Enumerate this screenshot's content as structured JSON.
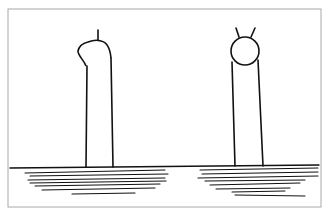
{
  "figure": {
    "colors": {
      "background": "#ffffff",
      "frame": "#a8a8a8",
      "ink": "#111111"
    },
    "frame": {
      "x": 8,
      "y": 9,
      "width": 313,
      "height": 198
    },
    "ground_line": {
      "x1": 10,
      "y1": 168,
      "x2": 319,
      "y2": 165
    },
    "left_figure": {
      "name": "figure-with-single-spike",
      "body_left": [
        [
          87,
          66
        ],
        [
          86,
          167
        ]
      ],
      "body_right": [
        [
          111,
          58
        ],
        [
          113,
          167
        ]
      ],
      "head_path": "M86 66 C84 60 78 56 78 51 C79 46 84 43 88 42 C93 40 98 40 101 41 C106 42 110 48 111 58",
      "spike": [
        [
          98,
          40
        ],
        [
          98,
          30
        ]
      ]
    },
    "right_figure": {
      "name": "figure-with-round-head-and-two-horns",
      "head_circle": {
        "cx": 245,
        "cy": 51,
        "r": 14
      },
      "body_left": [
        [
          232,
          62
        ],
        [
          235,
          166
        ]
      ],
      "body_right": [
        [
          258,
          60
        ],
        [
          263,
          166
        ]
      ],
      "horns": [
        [
          [
            239,
            37
          ],
          [
            236,
            28
          ]
        ],
        [
          [
            251,
            37
          ],
          [
            255,
            28
          ]
        ]
      ]
    },
    "hatching_left": [
      [
        [
          25,
          173
        ],
        [
          165,
          170
        ]
      ],
      [
        [
          30,
          176
        ],
        [
          168,
          174
        ]
      ],
      [
        [
          28,
          180
        ],
        [
          165,
          178
        ]
      ],
      [
        [
          30,
          183
        ],
        [
          166,
          181
        ]
      ],
      [
        [
          35,
          186
        ],
        [
          160,
          184
        ]
      ],
      [
        [
          42,
          190
        ],
        [
          155,
          188
        ]
      ],
      [
        [
          72,
          194
        ],
        [
          135,
          193
        ]
      ]
    ],
    "hatching_right": [
      [
        [
          200,
          170
        ],
        [
          318,
          168
        ]
      ],
      [
        [
          202,
          174
        ],
        [
          318,
          172
        ]
      ],
      [
        [
          198,
          178
        ],
        [
          318,
          176
        ]
      ],
      [
        [
          205,
          181
        ],
        [
          305,
          180
        ]
      ],
      [
        [
          210,
          185
        ],
        [
          300,
          183
        ]
      ],
      [
        [
          216,
          189
        ],
        [
          290,
          188
        ]
      ],
      [
        [
          232,
          192
        ],
        [
          285,
          191
        ]
      ],
      [
        [
          235,
          195
        ],
        [
          305,
          196
        ]
      ]
    ]
  }
}
